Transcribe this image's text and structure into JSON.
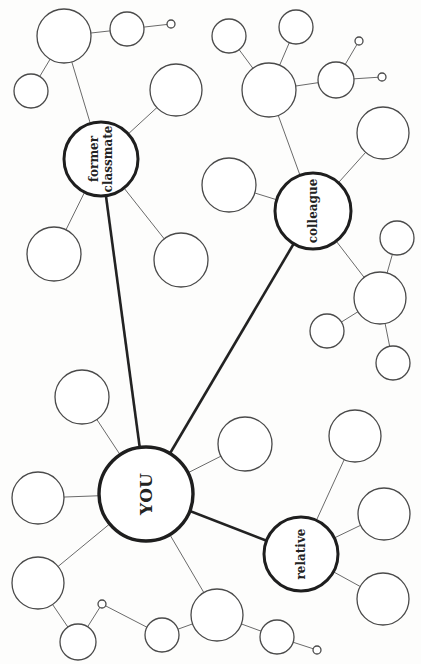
{
  "diagram": {
    "type": "mind-map",
    "orientation": "rotated-90-ccw",
    "center": {
      "id": "you",
      "label": "YOU",
      "x": 146,
      "y": 494,
      "r": 47,
      "font_size": 17
    },
    "primary_nodes": [
      {
        "id": "former-classmate",
        "lines": [
          "former",
          "classmate"
        ],
        "x": 101,
        "y": 159,
        "r": 37,
        "font_size": 12
      },
      {
        "id": "colleague",
        "lines": [
          "colleague"
        ],
        "x": 313,
        "y": 211,
        "r": 38,
        "font_size": 12
      },
      {
        "id": "relative",
        "lines": [
          "relative"
        ],
        "x": 301,
        "y": 554,
        "r": 37,
        "font_size": 12
      }
    ],
    "blank_nodes": [
      {
        "id": "fc-hub",
        "x": 64,
        "y": 36,
        "r": 27
      },
      {
        "id": "fc-hub-right",
        "x": 127,
        "y": 29,
        "r": 17
      },
      {
        "id": "fc-hub-left",
        "x": 31,
        "y": 91,
        "r": 17
      },
      {
        "id": "fc-upper-right",
        "x": 176,
        "y": 90,
        "r": 26
      },
      {
        "id": "fc-lower-left",
        "x": 54,
        "y": 254,
        "r": 27
      },
      {
        "id": "fc-lower-right",
        "x": 181,
        "y": 260,
        "r": 27
      },
      {
        "id": "col-left",
        "x": 229,
        "y": 185,
        "r": 27
      },
      {
        "id": "col-hub",
        "x": 269,
        "y": 90,
        "r": 27
      },
      {
        "id": "col-hub-left",
        "x": 229,
        "y": 36,
        "r": 17
      },
      {
        "id": "col-hub-top",
        "x": 296,
        "y": 27,
        "r": 17
      },
      {
        "id": "col-hub-mid",
        "x": 336,
        "y": 80,
        "r": 18
      },
      {
        "id": "col-right",
        "x": 383,
        "y": 133,
        "r": 26
      },
      {
        "id": "col-low-hub",
        "x": 380,
        "y": 298,
        "r": 26
      },
      {
        "id": "col-low-top",
        "x": 397,
        "y": 238,
        "r": 17
      },
      {
        "id": "col-low-left",
        "x": 327,
        "y": 331,
        "r": 17
      },
      {
        "id": "col-low-bottom",
        "x": 393,
        "y": 363,
        "r": 17
      },
      {
        "id": "you-upper-left",
        "x": 82,
        "y": 397,
        "r": 27
      },
      {
        "id": "you-left",
        "x": 38,
        "y": 498,
        "r": 26
      },
      {
        "id": "you-right",
        "x": 245,
        "y": 444,
        "r": 27
      },
      {
        "id": "you-lower-left",
        "x": 38,
        "y": 583,
        "r": 26
      },
      {
        "id": "you-ll-small",
        "x": 78,
        "y": 642,
        "r": 18
      },
      {
        "id": "you-bottom-mid",
        "x": 162,
        "y": 635,
        "r": 17
      },
      {
        "id": "you-bottom-hub",
        "x": 217,
        "y": 615,
        "r": 26
      },
      {
        "id": "you-bh-small",
        "x": 277,
        "y": 637,
        "r": 17
      },
      {
        "id": "rel-top",
        "x": 355,
        "y": 436,
        "r": 26
      },
      {
        "id": "rel-mid",
        "x": 384,
        "y": 514,
        "r": 26
      },
      {
        "id": "rel-bottom",
        "x": 383,
        "y": 599,
        "r": 26
      }
    ],
    "terminal_dots": [
      {
        "id": "dot-fc",
        "x": 171,
        "y": 24,
        "r": 4
      },
      {
        "id": "dot-col-1",
        "x": 359,
        "y": 41,
        "r": 4
      },
      {
        "id": "dot-col-2",
        "x": 382,
        "y": 77,
        "r": 4
      },
      {
        "id": "dot-you-ll",
        "x": 102,
        "y": 604,
        "r": 4
      },
      {
        "id": "dot-you-bh",
        "x": 317,
        "y": 650,
        "r": 4
      }
    ],
    "thick_edges": [
      [
        "you",
        "former-classmate"
      ],
      [
        "you",
        "colleague"
      ],
      [
        "you",
        "relative"
      ]
    ],
    "thin_edges": [
      [
        "former-classmate",
        "fc-hub"
      ],
      [
        "fc-hub",
        "fc-hub-right"
      ],
      [
        "fc-hub-right",
        "dot-fc"
      ],
      [
        "fc-hub",
        "fc-hub-left"
      ],
      [
        "former-classmate",
        "fc-upper-right"
      ],
      [
        "former-classmate",
        "fc-lower-left"
      ],
      [
        "former-classmate",
        "fc-lower-right"
      ],
      [
        "colleague",
        "col-left"
      ],
      [
        "colleague",
        "col-hub"
      ],
      [
        "col-hub",
        "col-hub-left"
      ],
      [
        "col-hub",
        "col-hub-top"
      ],
      [
        "col-hub",
        "col-hub-mid"
      ],
      [
        "col-hub-mid",
        "dot-col-1"
      ],
      [
        "col-hub-mid",
        "dot-col-2"
      ],
      [
        "colleague",
        "col-right"
      ],
      [
        "colleague",
        "col-low-hub"
      ],
      [
        "col-low-hub",
        "col-low-top"
      ],
      [
        "col-low-hub",
        "col-low-left"
      ],
      [
        "col-low-hub",
        "col-low-bottom"
      ],
      [
        "you",
        "you-upper-left"
      ],
      [
        "you",
        "you-left"
      ],
      [
        "you",
        "you-right"
      ],
      [
        "you",
        "you-lower-left"
      ],
      [
        "you-lower-left",
        "you-ll-small"
      ],
      [
        "you-ll-small",
        "dot-you-ll"
      ],
      [
        "dot-you-ll",
        "you-bottom-mid"
      ],
      [
        "you",
        "you-bottom-hub"
      ],
      [
        "you-bottom-hub",
        "you-bottom-mid"
      ],
      [
        "you-bottom-hub",
        "you-bh-small"
      ],
      [
        "you-bh-small",
        "dot-you-bh"
      ],
      [
        "relative",
        "rel-top"
      ],
      [
        "relative",
        "rel-mid"
      ],
      [
        "relative",
        "rel-bottom"
      ]
    ]
  }
}
